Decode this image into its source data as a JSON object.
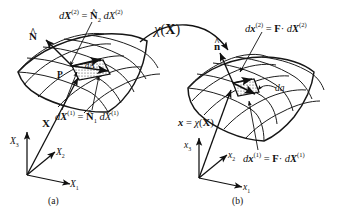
{
  "figure": {
    "type": "continuum-mechanics-deformation-diagram",
    "colors": {
      "ink": "#111111",
      "line": "#1a1a1a",
      "background": "#ffffff",
      "hatch": "#555555",
      "surface": "#ffffff"
    }
  },
  "panel_a": {
    "caption": "(a)",
    "name": "reference-configuration",
    "point_label": "P",
    "area_label": "dA",
    "normal_label": "N",
    "normal_hat": "^",
    "position_vector_label": "X",
    "edge_vector_2": {
      "lhs_d": "d",
      "lhs_X": "X",
      "lhs_sup": "(2)",
      "eq": "=",
      "rhs_N": "N",
      "rhs_hat": "^",
      "rhs_sub": "2",
      "rhs_d": "d",
      "rhs_X": "X",
      "rhs_sup": "(2)",
      "full": "dX(2) = N2 dX(2)"
    },
    "edge_vector_1": {
      "lhs_d": "d",
      "lhs_X": "X",
      "lhs_sup": "(1)",
      "eq": "=",
      "rhs_N": "N",
      "rhs_hat": "^",
      "rhs_sub": "1",
      "rhs_d": "d",
      "rhs_X": "X",
      "rhs_sup": "(1)",
      "full": "dX(1) = N1 dX(1)"
    },
    "axes": [
      {
        "label": "X",
        "sub": "1",
        "name": "axis-X1",
        "direction": "right"
      },
      {
        "label": "X",
        "sub": "2",
        "name": "axis-X2",
        "direction": "diagonal"
      },
      {
        "label": "X",
        "sub": "3",
        "name": "axis-X3",
        "direction": "up"
      }
    ]
  },
  "panel_b": {
    "caption": "(b)",
    "name": "current-configuration",
    "area_label": "da",
    "normal_label": "n",
    "normal_hat": "^",
    "position_vector": {
      "x": "x",
      "eq": "=",
      "chi": "χ",
      "arg_open": "(",
      "arg": "X",
      "arg_close": ")",
      "full": "x = χ(X)"
    },
    "edge_vector_2": {
      "lhs_d": "d",
      "lhs_x": "x",
      "lhs_sup": "(2)",
      "eq": "=",
      "rhs_F": "F",
      "dot": "·",
      "rhs_d": "d",
      "rhs_X": "X",
      "rhs_sup": "(2)",
      "full": "dx(2) = F · dX(2)"
    },
    "edge_vector_1": {
      "lhs_d": "d",
      "lhs_x": "x",
      "lhs_sup": "(1)",
      "eq": "=",
      "rhs_F": "F",
      "dot": "·",
      "rhs_d": "d",
      "rhs_X": "X",
      "rhs_sup": "(1)",
      "full": "dx(1) = F · dX(1)"
    },
    "axes": [
      {
        "label": "x",
        "sub": "1",
        "name": "axis-x1",
        "direction": "right"
      },
      {
        "label": "x",
        "sub": "2",
        "name": "axis-x2",
        "direction": "diagonal"
      },
      {
        "label": "x",
        "sub": "3",
        "name": "axis-x3",
        "direction": "up"
      }
    ]
  },
  "mapping": {
    "name": "deformation-map",
    "chi": "χ",
    "arg_open": "(",
    "arg": "X",
    "arg_close": ")",
    "full": "χ(X)"
  }
}
